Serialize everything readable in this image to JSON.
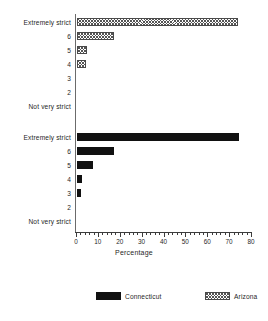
{
  "chart_data": {
    "type": "bar",
    "orientation": "horizontal",
    "title": "",
    "xlabel": "Percentage",
    "ylabel": "",
    "xlim": [
      0,
      80
    ],
    "xticks": [
      0,
      10,
      20,
      30,
      40,
      50,
      60,
      70,
      80
    ],
    "xtick_labels": [
      "0",
      "10",
      "20",
      "30",
      "40",
      "50",
      "60",
      "70",
      "80"
    ],
    "minor_tick_step": 2,
    "grid": false,
    "legend_position": "bottom",
    "categories": [
      "Extremely strict",
      "6",
      "5",
      "4",
      "3",
      "2",
      "Not very strict"
    ],
    "series": [
      {
        "name": "Arizona",
        "fill": "hatch",
        "color": "#555555",
        "panel": "top",
        "values": [
          73.6,
          16.9,
          4.6,
          4.0,
          0,
          0,
          0
        ]
      },
      {
        "name": "Connecticut",
        "fill": "solid",
        "color": "#111111",
        "panel": "bottom",
        "values": [
          74.0,
          17.0,
          7.2,
          2.2,
          1.6,
          0,
          0
        ]
      }
    ]
  },
  "panels": {
    "top": {
      "series_name": "Arizona",
      "rows": [
        {
          "label": "Extremely strict",
          "value": 73.6
        },
        {
          "label": "6",
          "value": 16.9
        },
        {
          "label": "5",
          "value": 4.6
        },
        {
          "label": "4",
          "value": 4.0
        },
        {
          "label": "3",
          "value": 0
        },
        {
          "label": "2",
          "value": 0
        },
        {
          "label": "Not very strict",
          "value": 0
        }
      ]
    },
    "bottom": {
      "series_name": "Connecticut",
      "rows": [
        {
          "label": "Extremely strict",
          "value": 74.0
        },
        {
          "label": "6",
          "value": 17.0
        },
        {
          "label": "5",
          "value": 7.2
        },
        {
          "label": "4",
          "value": 2.2
        },
        {
          "label": "3",
          "value": 1.6
        },
        {
          "label": "2",
          "value": 0
        },
        {
          "label": "Not very strict",
          "value": 0
        }
      ]
    }
  },
  "axis": {
    "x_title": "Percentage",
    "tick_labels": [
      "0",
      "10",
      "20",
      "30",
      "40",
      "50",
      "60",
      "70",
      "80"
    ]
  },
  "legend": {
    "items": [
      {
        "label": "Connecticut",
        "fill": "solid"
      },
      {
        "label": "Arizona",
        "fill": "hatch"
      }
    ]
  }
}
